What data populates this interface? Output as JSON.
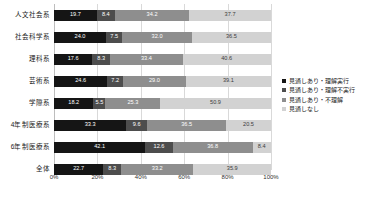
{
  "chart_data": {
    "type": "bar",
    "orientation": "horizontal",
    "stacked": true,
    "normalized": true,
    "title": "",
    "subtitle": "",
    "xlabel": "",
    "ylabel": "",
    "xlim": [
      0,
      100
    ],
    "xticks": [
      "0%",
      "20%",
      "40%",
      "60%",
      "80%",
      "100%"
    ],
    "xtick_values": [
      0,
      20,
      40,
      60,
      80,
      100
    ],
    "grid": true,
    "legend_position": "right",
    "categories": [
      "人文社会系",
      "社会科学系",
      "理科系",
      "芸術系",
      "学際系",
      "4年制医療系",
      "6年制医療系",
      "全体"
    ],
    "series": [
      {
        "name": "見通しあり・理解実行",
        "color": "#151515",
        "values": [
          19.7,
          24.0,
          17.6,
          24.6,
          18.2,
          33.3,
          42.1,
          22.7
        ]
      },
      {
        "name": "見通しあり・理解不実行",
        "color": "#4d4d4d",
        "values": [
          8.4,
          7.5,
          8.3,
          7.2,
          5.5,
          9.6,
          12.6,
          8.3
        ]
      },
      {
        "name": "見通しあり・不理解",
        "color": "#8e8e8e",
        "values": [
          34.2,
          32.0,
          33.4,
          29.0,
          25.3,
          36.5,
          36.8,
          33.2
        ]
      },
      {
        "name": "見通しなし",
        "color": "#d2d2d2",
        "values": [
          37.7,
          36.5,
          40.6,
          39.1,
          50.9,
          20.5,
          8.4,
          35.9
        ]
      }
    ]
  }
}
